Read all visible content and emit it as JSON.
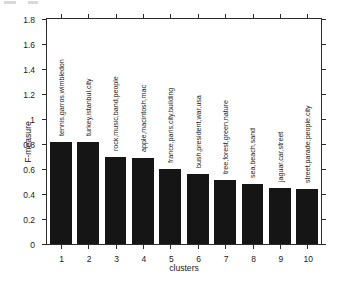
{
  "chart_data": {
    "type": "bar",
    "title": "",
    "xlabel": "clusters",
    "ylabel": "F-measure",
    "categories": [
      "1",
      "2",
      "3",
      "4",
      "5",
      "6",
      "7",
      "8",
      "9",
      "10"
    ],
    "values": [
      0.82,
      0.82,
      0.7,
      0.69,
      0.6,
      0.56,
      0.51,
      0.48,
      0.45,
      0.44
    ],
    "bar_labels": [
      "tennis,garros,wimbledon",
      "turkey,istanbul,city",
      "rock,music,band,people",
      "apple,macintosh,mac",
      "france,paris,city,building",
      "bush,president,war,usa",
      "tree,forest,green,nature",
      "sea,beach,sand",
      "jaguar,car,street",
      "street,parade,people,city"
    ],
    "ylim": [
      0,
      1.8
    ],
    "yticks": [
      "0",
      "0.2",
      "0.4",
      "0.6",
      "0.8",
      "1",
      "1.2",
      "1.4",
      "1.6",
      "1.8"
    ],
    "ytick_values": [
      0,
      0.2,
      0.4,
      0.6,
      0.8,
      1.0,
      1.2,
      1.4,
      1.6,
      1.8
    ],
    "grid": false,
    "legend": false,
    "bar_color": "#151515",
    "axis_color": "#2b2b2b",
    "background": "#ffffff"
  }
}
